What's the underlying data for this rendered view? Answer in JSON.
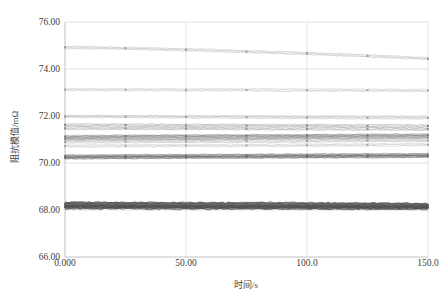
{
  "chart_data": {
    "type": "line",
    "title": "",
    "xlabel": "时间/s",
    "ylabel": "阻抗模值/mΩ",
    "xlim": [
      0,
      150
    ],
    "ylim": [
      66.0,
      76.0
    ],
    "grid": true,
    "legend": "none",
    "x_ticks": [
      "0.000",
      "50.00",
      "100.0",
      "150.0"
    ],
    "x_tick_values": [
      0,
      50,
      100,
      150
    ],
    "y_ticks": [
      "66.00",
      "68.00",
      "70.00",
      "72.00",
      "74.00",
      "76.00"
    ],
    "y_tick_values": [
      66,
      68,
      70,
      72,
      74,
      76
    ],
    "marker_x": [
      0,
      25,
      50,
      75,
      100,
      125,
      150
    ],
    "series": [
      {
        "name": "trace-01",
        "color": "#8a8a8a",
        "width": 0.6,
        "markers": true,
        "values": [
          74.92,
          74.88,
          74.82,
          74.74,
          74.66,
          74.56,
          74.44
        ]
      },
      {
        "name": "trace-02",
        "color": "#9a9a9a",
        "width": 0.6,
        "markers": true,
        "values": [
          73.12,
          73.12,
          73.11,
          73.11,
          73.1,
          73.1,
          73.09
        ]
      },
      {
        "name": "trace-03",
        "color": "#8f8f8f",
        "width": 0.6,
        "markers": true,
        "values": [
          71.98,
          71.97,
          71.96,
          71.95,
          71.94,
          71.93,
          71.92
        ]
      },
      {
        "name": "trace-04",
        "color": "#777777",
        "width": 0.7,
        "markers": true,
        "values": [
          71.62,
          71.61,
          71.6,
          71.6,
          71.59,
          71.58,
          71.57
        ]
      },
      {
        "name": "trace-05",
        "color": "#7d7d7d",
        "width": 0.7,
        "markers": true,
        "values": [
          71.48,
          71.47,
          71.47,
          71.46,
          71.45,
          71.45,
          71.44
        ]
      },
      {
        "name": "trace-06",
        "color": "#6f6f6f",
        "width": 0.8,
        "markers": true,
        "values": [
          71.12,
          71.14,
          71.15,
          71.16,
          71.17,
          71.18,
          71.19
        ]
      },
      {
        "name": "trace-07",
        "color": "#858585",
        "width": 0.8,
        "markers": true,
        "values": [
          71.02,
          71.03,
          71.04,
          71.05,
          71.07,
          71.08,
          71.09
        ]
      },
      {
        "name": "trace-08",
        "color": "#909090",
        "width": 0.7,
        "markers": true,
        "values": [
          70.9,
          70.91,
          70.92,
          70.93,
          70.94,
          70.95,
          70.96
        ]
      },
      {
        "name": "trace-09",
        "color": "#9c9c9c",
        "width": 0.6,
        "markers": true,
        "values": [
          70.72,
          70.73,
          70.74,
          70.75,
          70.76,
          70.77,
          70.78
        ]
      },
      {
        "name": "trace-10",
        "color": "#707070",
        "width": 0.9,
        "markers": true,
        "values": [
          70.3,
          70.31,
          70.32,
          70.33,
          70.34,
          70.35,
          70.36
        ]
      },
      {
        "name": "trace-11",
        "color": "#626262",
        "width": 0.9,
        "markers": true,
        "values": [
          70.22,
          70.23,
          70.24,
          70.25,
          70.26,
          70.27,
          70.28
        ]
      },
      {
        "name": "trace-12",
        "color": "#555555",
        "width": 1.6,
        "markers": true,
        "values": [
          68.26,
          68.25,
          68.24,
          68.24,
          68.23,
          68.22,
          68.21
        ]
      },
      {
        "name": "trace-13",
        "color": "#6a6a6a",
        "width": 1.4,
        "markers": true,
        "values": [
          68.18,
          68.18,
          68.17,
          68.17,
          68.16,
          68.16,
          68.15
        ]
      },
      {
        "name": "trace-14",
        "color": "#4f4f4f",
        "width": 1.2,
        "markers": true,
        "values": [
          68.12,
          68.12,
          68.11,
          68.11,
          68.11,
          68.1,
          68.1
        ]
      }
    ]
  },
  "axes": {
    "frame_color": "#cccccc",
    "grid_color": "#d6d6d6",
    "tick_text_color": "#3d3d3d"
  }
}
